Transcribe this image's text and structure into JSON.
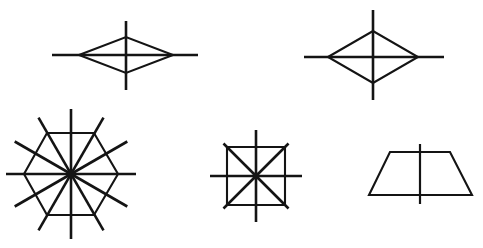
{
  "page": {
    "background_color": "#ffffff",
    "ink_color": "#141414",
    "width": 483,
    "height": 248,
    "figure_count": 5
  },
  "chart_data": {
    "type": "diagram",
    "subtitle": "",
    "xlabel": "",
    "ylabel": "",
    "grid": false,
    "legend": null,
    "annotations": [],
    "figures": [
      {
        "id": "figure-1",
        "name": "flat-rhombus",
        "label": "Flat rhombus with two axes of symmetry",
        "shape": "rhombus",
        "center": [
          126,
          55
        ],
        "half_width": 47,
        "half_height": 18,
        "axis_count": 2,
        "vertices": [
          [
            79,
            55
          ],
          [
            126,
            37
          ],
          [
            173,
            55
          ],
          [
            126,
            73
          ]
        ],
        "axes": [
          {
            "name": "horizontal-axis",
            "x1": 52,
            "y1": 55,
            "x2": 198,
            "y2": 55
          },
          {
            "name": "vertical-axis",
            "x1": 126,
            "y1": 21,
            "x2": 126,
            "y2": 90
          }
        ]
      },
      {
        "id": "figure-2",
        "name": "tall-rhombus",
        "label": "Rhombus with two axes of symmetry",
        "shape": "rhombus",
        "center": [
          373,
          57
        ],
        "half_width": 45,
        "half_height": 26,
        "axis_count": 2,
        "vertices": [
          [
            328,
            57
          ],
          [
            373,
            31
          ],
          [
            418,
            57
          ],
          [
            373,
            83
          ]
        ],
        "axes": [
          {
            "name": "horizontal-axis",
            "x1": 304,
            "y1": 57,
            "x2": 444,
            "y2": 57
          },
          {
            "name": "vertical-axis",
            "x1": 373,
            "y1": 10,
            "x2": 373,
            "y2": 100
          }
        ]
      },
      {
        "id": "figure-3",
        "name": "regular-hexagon",
        "label": "Regular hexagon with six axes of symmetry",
        "shape": "hexagon",
        "center": [
          71,
          174
        ],
        "circumradius": 47,
        "rotation_deg": 0,
        "axis_count": 6,
        "spoke_count": 12,
        "spoke_length": 65,
        "vertices": [
          [
            118,
            174
          ],
          [
            94,
            215
          ],
          [
            47,
            215
          ],
          [
            24,
            174
          ],
          [
            47,
            133
          ],
          [
            94,
            133
          ]
        ],
        "axes": [
          {
            "name": "axis-0deg",
            "angle_deg": 0,
            "through": "vertices"
          },
          {
            "name": "axis-30deg",
            "angle_deg": 30,
            "through": "edge-midpoints"
          },
          {
            "name": "axis-60deg",
            "angle_deg": 60,
            "through": "vertices"
          },
          {
            "name": "axis-90deg",
            "angle_deg": 90,
            "through": "edge-midpoints"
          },
          {
            "name": "axis-120deg",
            "angle_deg": 120,
            "through": "vertices"
          },
          {
            "name": "axis-150deg",
            "angle_deg": 150,
            "through": "edge-midpoints"
          }
        ]
      },
      {
        "id": "figure-4",
        "name": "square",
        "label": "Square with four axes of symmetry",
        "shape": "square",
        "center": [
          256,
          176
        ],
        "half_side": 29,
        "axis_count": 4,
        "spoke_count": 8,
        "spoke_length": 46,
        "vertices": [
          [
            227,
            147
          ],
          [
            285,
            147
          ],
          [
            285,
            205
          ],
          [
            227,
            205
          ]
        ],
        "axes": [
          {
            "name": "axis-horizontal",
            "angle_deg": 0,
            "through": "edge-midpoints"
          },
          {
            "name": "axis-diagonal-up",
            "angle_deg": 45,
            "through": "vertices"
          },
          {
            "name": "axis-vertical",
            "angle_deg": 90,
            "through": "edge-midpoints"
          },
          {
            "name": "axis-diagonal-down",
            "angle_deg": 135,
            "through": "vertices"
          }
        ]
      },
      {
        "id": "figure-5",
        "name": "isosceles-trapezoid",
        "label": "Isosceles trapezoid with one axis of symmetry",
        "shape": "trapezoid",
        "center": [
          420,
          174
        ],
        "top_width": 60,
        "bottom_width": 103,
        "height": 43,
        "axis_count": 1,
        "vertices": [
          [
            390,
            152
          ],
          [
            450,
            152
          ],
          [
            472,
            195
          ],
          [
            369,
            195
          ]
        ],
        "axes": [
          {
            "name": "vertical-axis",
            "x1": 420,
            "y1": 144,
            "x2": 420,
            "y2": 204
          }
        ]
      }
    ]
  }
}
